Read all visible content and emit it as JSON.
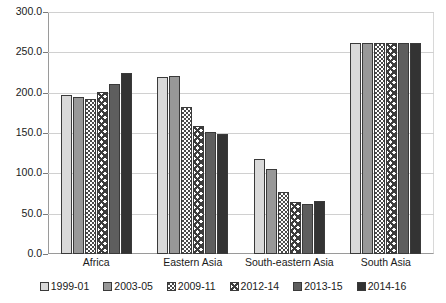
{
  "chart_data": {
    "type": "bar",
    "title": "",
    "xlabel": "",
    "ylabel": "",
    "ylim": [
      0,
      300
    ],
    "ytick_step": 50,
    "ytick_labels": [
      "300.0",
      "250.0",
      "200.0",
      "150.0",
      "100.0",
      "50.0",
      "0.0"
    ],
    "ytick_values": [
      300,
      250,
      200,
      150,
      100,
      50,
      0
    ],
    "grid": true,
    "legend_position": "bottom",
    "categories": [
      "Africa",
      "Eastern Asia",
      "South-eastern Asia",
      "South Asia"
    ],
    "series": [
      {
        "name": "1999-01",
        "pattern": "light-gray-solid",
        "color": "#d9d9d9",
        "values": [
          197,
          219,
          118,
          261
        ]
      },
      {
        "name": "2003-05",
        "pattern": "medium-gray-solid",
        "color": "#989898",
        "values": [
          195,
          221,
          105,
          261
        ]
      },
      {
        "name": "2009-11",
        "pattern": "dotted",
        "color": "#ffffff",
        "values": [
          192,
          182,
          77,
          261
        ]
      },
      {
        "name": "2012-14",
        "pattern": "crosshatch",
        "color": "#ffffff",
        "values": [
          201,
          159,
          64,
          261
        ]
      },
      {
        "name": "2013-15",
        "pattern": "dark-gray-solid",
        "color": "#5e5e5e",
        "values": [
          211,
          151,
          62,
          261
        ]
      },
      {
        "name": "2014-16",
        "pattern": "darkest-gray-solid",
        "color": "#333333",
        "values": [
          224,
          149,
          66,
          261
        ]
      }
    ]
  },
  "legend": {
    "items": [
      {
        "label": "1999-01"
      },
      {
        "label": "2003-05"
      },
      {
        "label": "2009-11"
      },
      {
        "label": "2012-14"
      },
      {
        "label": "2013-15"
      },
      {
        "label": "2014-16"
      }
    ]
  }
}
